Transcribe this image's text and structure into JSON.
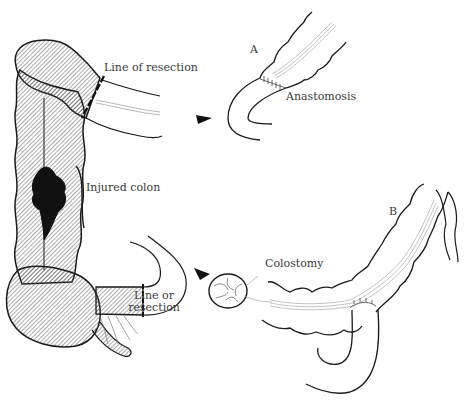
{
  "figure": {
    "colors": {
      "ink": "#1a1a1a",
      "label_text": "#3a3a3a",
      "hatch": "#555555",
      "vessel": "#888888",
      "background": "#ffffff"
    }
  },
  "left_panel": {
    "labels": {
      "line_of_resection_top": "Line of resection",
      "injured_colon": "Injured colon",
      "line_of_resection_bottom_1": "Line or",
      "line_of_resection_bottom_2": "resection"
    }
  },
  "panel_a": {
    "letter": "A",
    "labels": {
      "anastomosis": "Anastomosis"
    }
  },
  "panel_b": {
    "letter": "B",
    "labels": {
      "colostomy": "Colostomy"
    }
  },
  "arrows": [
    {
      "name": "arrow-to-panel-a",
      "direction": "right"
    },
    {
      "name": "arrow-to-panel-b",
      "direction": "down-right"
    }
  ]
}
